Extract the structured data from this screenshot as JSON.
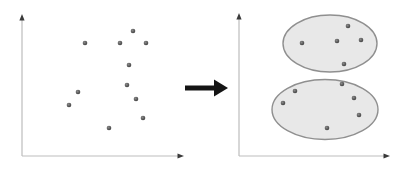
{
  "diagram": {
    "kind": "clustering-before-after",
    "point_radius": 2.3,
    "colors": {
      "background": "#ffffff",
      "axis_line": "#bdbdbd",
      "axis_arrowhead": "#3a3a3a",
      "point_center": "#8a8a8a",
      "point_edge": "#3e3e3e",
      "ellipse_fill": "#e8e8e8",
      "ellipse_stroke": "#8f8f8f",
      "transform_arrow": "#141414"
    },
    "left_plot": {
      "axes": {
        "origin_x": 22,
        "origin_y": 156,
        "x_tip": 184,
        "y_tip": 14
      },
      "points": [
        [
          133,
          31
        ],
        [
          85,
          43
        ],
        [
          120,
          43
        ],
        [
          146,
          43
        ],
        [
          129,
          65
        ],
        [
          127,
          85
        ],
        [
          78,
          92
        ],
        [
          69,
          105
        ],
        [
          136,
          99
        ],
        [
          143,
          118
        ],
        [
          109,
          128
        ]
      ]
    },
    "transform_arrow": {
      "shaft_x1": 185,
      "shaft_x2": 215,
      "y": 88,
      "shaft_width": 5,
      "tip_x": 228,
      "head_half_height": 8.5
    },
    "right_plot": {
      "axes": {
        "origin_x": 239,
        "origin_y": 156,
        "x_tip": 390,
        "y_tip": 13
      },
      "clusters": [
        {
          "ellipse": {
            "cx": 330,
            "cy": 43.5,
            "rx": 47,
            "ry": 28.5
          },
          "points": [
            [
              348,
              26
            ],
            [
              302,
              43
            ],
            [
              337,
              41
            ],
            [
              361,
              40
            ],
            [
              344,
              64
            ]
          ]
        },
        {
          "ellipse": {
            "cx": 325,
            "cy": 109.5,
            "rx": 53,
            "ry": 30
          },
          "points": [
            [
              342,
              84
            ],
            [
              295,
              91
            ],
            [
              354,
              98
            ],
            [
              283,
              103
            ],
            [
              359,
              115
            ],
            [
              327,
              128
            ]
          ]
        }
      ]
    }
  }
}
